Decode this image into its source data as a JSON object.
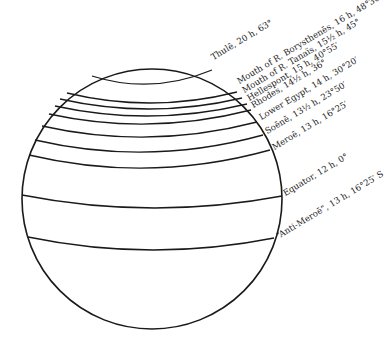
{
  "figure": {
    "type": "globe with climata parallels",
    "stroke_color": "#1a1a1a",
    "background": "#ffffff",
    "globe": {
      "cx": 152,
      "cy": 199,
      "r": 130
    },
    "parallels": [
      {
        "name": "Thulē",
        "hours": "20 h",
        "latitude": "63°",
        "label": "Thulē, 20 h, 63°",
        "left": [
          92,
          76
        ],
        "mid_y": 84,
        "right": [
          212,
          70
        ],
        "label_pos": [
          214,
          62
        ]
      },
      {
        "name": "Mouth of R. Borysthenēs",
        "hours": "16 h",
        "latitude": "48°30′",
        "label": "Mouth of R. Borysthenēs, 16 h, 48°30′",
        "left": [
          67,
          93
        ],
        "mid_y": 103,
        "right": [
          237,
          92
        ],
        "label_pos": [
          240,
          86
        ]
      },
      {
        "name": "Mouth of R. Tanaïs",
        "hours": "15½ h",
        "latitude": "45°",
        "label": "Mouth of R. Tanaïs, 15½ h, 45°",
        "left": [
          60,
          99
        ],
        "mid_y": 109,
        "right": [
          242,
          98
        ],
        "label_pos": [
          245,
          95
        ]
      },
      {
        "name": "Hellespont",
        "hours": "15 h",
        "latitude": "40°55′",
        "label": "Hellespont, 15 h, 40°55′",
        "left": [
          55,
          106
        ],
        "mid_y": 116,
        "right": [
          247,
          104
        ],
        "label_pos": [
          250,
          103
        ]
      },
      {
        "name": "Rhodes",
        "hours": "14½ h",
        "latitude": "36°",
        "label": "Rhodes, 14½ h, 36°",
        "left": [
          49,
          114
        ],
        "mid_y": 124,
        "right": [
          251,
          110
        ],
        "label_pos": [
          254,
          110
        ]
      },
      {
        "name": "Lower Egypt",
        "hours": "14 h",
        "latitude": "30°20′",
        "label": "Lower Egypt, 14 h, 30°20′",
        "left": [
          42,
          126
        ],
        "mid_y": 137,
        "right": [
          257,
          122
        ],
        "label_pos": [
          262,
          122
        ]
      },
      {
        "name": "Soēnē",
        "hours": "13½ h",
        "latitude": "23°50′",
        "label": "Soēnē, 13½ h, 23°50′",
        "left": [
          35,
          140
        ],
        "mid_y": 152,
        "right": [
          263,
          135
        ],
        "label_pos": [
          268,
          136
        ]
      },
      {
        "name": "Meroē",
        "hours": "13 h",
        "latitude": "16°25′",
        "label": "Meroē, 13 h, 16°25′",
        "left": [
          29,
          155
        ],
        "mid_y": 168,
        "right": [
          270,
          150
        ],
        "label_pos": [
          275,
          152
        ]
      },
      {
        "name": "Equator",
        "hours": "12 h",
        "latitude": "0°",
        "label": "Equator, 12 h, 0°",
        "left": [
          22,
          195
        ],
        "mid_y": 208,
        "right": [
          282,
          196
        ],
        "label_pos": [
          286,
          198
        ]
      },
      {
        "name": "“Anti-Meroē”",
        "hours": "13 h",
        "latitude": "16°25′ S",
        "label": "“Anti-Meroē”, 13 h, 16°25′ S",
        "left": [
          28,
          237
        ],
        "mid_y": 250,
        "right": [
          274,
          238
        ],
        "label_pos": [
          279,
          241
        ]
      }
    ]
  }
}
